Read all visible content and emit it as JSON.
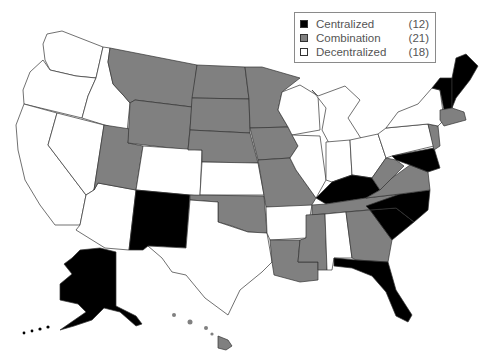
{
  "legend": {
    "items": [
      {
        "label": "Centralized",
        "count": "(12)",
        "color": "#000000"
      },
      {
        "label": "Combination",
        "count": "(21)",
        "color": "#808080"
      },
      {
        "label": "Decentralized",
        "count": "(18)",
        "color": "#ffffff"
      }
    ]
  },
  "colors": {
    "centralized": "#000000",
    "combination": "#808080",
    "decentralized": "#ffffff",
    "border": "#333333"
  },
  "states": {
    "centralized": [
      "Alaska",
      "New Mexico",
      "Kentucky",
      "North Carolina",
      "South Carolina",
      "Florida",
      "Maryland",
      "Delaware",
      "Maine",
      "New Hampshire",
      "Vermont",
      "District of Columbia"
    ],
    "combination": [
      "Montana",
      "Wyoming",
      "Utah",
      "North Dakota",
      "South Dakota",
      "Nebraska",
      "Minnesota",
      "Iowa",
      "Missouri",
      "Oklahoma",
      "Louisiana",
      "Mississippi",
      "Tennessee",
      "Georgia",
      "Virginia",
      "West Virginia",
      "New Jersey",
      "Massachusetts",
      "Connecticut",
      "Rhode Island",
      "Hawaii"
    ],
    "decentralized": [
      "Washington",
      "Oregon",
      "Idaho",
      "California",
      "Nevada",
      "Arizona",
      "Colorado",
      "Kansas",
      "Texas",
      "Arkansas",
      "Alabama",
      "Wisconsin",
      "Illinois",
      "Michigan",
      "Indiana",
      "Ohio",
      "Pennsylvania",
      "New York"
    ]
  }
}
